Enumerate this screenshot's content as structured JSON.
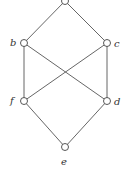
{
  "diagram": {
    "type": "hasse-diagram",
    "nodes": [
      {
        "id": "a",
        "label": "",
        "x": 65,
        "y": 1
      },
      {
        "id": "b",
        "label": "b",
        "x": 24,
        "y": 43
      },
      {
        "id": "c",
        "label": "c",
        "x": 107,
        "y": 43
      },
      {
        "id": "f",
        "label": "f",
        "x": 24,
        "y": 101
      },
      {
        "id": "d",
        "label": "d",
        "x": 107,
        "y": 101
      },
      {
        "id": "e",
        "label": "e",
        "x": 65,
        "y": 147
      }
    ],
    "edges": [
      [
        "a",
        "b"
      ],
      [
        "a",
        "c"
      ],
      [
        "b",
        "f"
      ],
      [
        "b",
        "d"
      ],
      [
        "c",
        "f"
      ],
      [
        "c",
        "d"
      ],
      [
        "f",
        "e"
      ],
      [
        "d",
        "e"
      ]
    ],
    "colors": {
      "line": "#555555",
      "node_fill": "#ffffff",
      "text": "#333333"
    }
  }
}
